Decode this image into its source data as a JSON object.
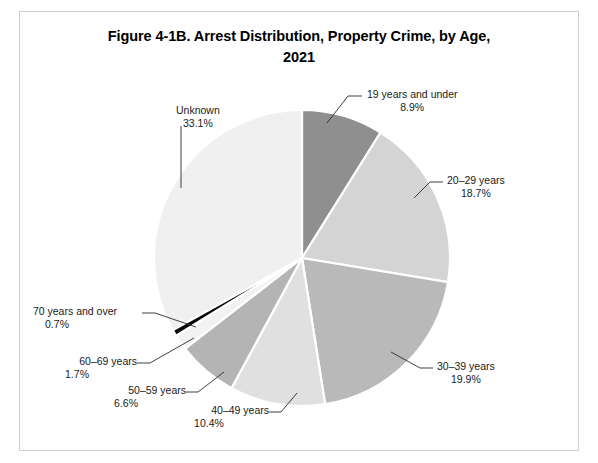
{
  "chart_data": {
    "type": "pie",
    "title_lines": [
      "Figure 4-1B. Arrest Distribution, Property Crime, by Age,",
      "2021"
    ],
    "units": "percent",
    "total": 100.0,
    "start_angle_deg": 0,
    "direction": "clockwise",
    "legend": "none (direct labels with leader lines)",
    "categories": [
      "19 years and under",
      "20–29 years",
      "30–39 years",
      "40–49 years",
      "50–59 years",
      "60–69 years",
      "70 years and over",
      "Unknown"
    ],
    "values": [
      8.9,
      18.7,
      19.9,
      10.4,
      6.6,
      1.7,
      0.7,
      33.1
    ],
    "colors": [
      "#8f8f8f",
      "#d4d4d4",
      "#b9b9b9",
      "#e0e0e0",
      "#b4b4b4",
      "#f2f2f2",
      "#0a0a0a",
      "#f0f0f0"
    ],
    "slices": [
      {
        "label": "19 years and under",
        "value": 8.9,
        "value_label": "8.9%",
        "color": "#8f8f8f",
        "label_x": 367,
        "label_y": 88,
        "align": "left",
        "leader": [
          [
            362,
            96
          ],
          [
            348,
            96
          ],
          [
            327,
            123
          ]
        ]
      },
      {
        "label": "20–29 years",
        "value": 18.7,
        "value_label": "18.7%",
        "color": "#d4d4d4",
        "label_x": 447,
        "label_y": 174,
        "align": "left",
        "leader": [
          [
            443,
            182
          ],
          [
            430,
            182
          ],
          [
            414,
            198
          ]
        ]
      },
      {
        "label": "30–39 years",
        "value": 19.9,
        "value_label": "19.9%",
        "color": "#b9b9b9",
        "label_x": 437,
        "label_y": 360,
        "align": "left",
        "leader": [
          [
            433,
            368
          ],
          [
            420,
            368
          ],
          [
            391,
            352
          ]
        ]
      },
      {
        "label": "40–49 years",
        "value": 10.4,
        "value_label": "10.4%",
        "color": "#e0e0e0",
        "label_x": 209,
        "label_y": 404,
        "align": "right",
        "leader": [
          [
            269,
            412
          ],
          [
            281,
            412
          ],
          [
            297,
            393
          ]
        ]
      },
      {
        "label": "50–59 years",
        "value": 6.6,
        "value_label": "6.6%",
        "color": "#b4b4b4",
        "label_x": 126,
        "label_y": 384,
        "align": "right",
        "leader": [
          [
            186,
            392
          ],
          [
            198,
            392
          ],
          [
            224,
            372
          ]
        ]
      },
      {
        "label": "60–69 years",
        "value": 1.7,
        "value_label": "1.7%",
        "color": "#f2f2f2",
        "label_x": 77,
        "label_y": 355,
        "align": "right",
        "leader": [
          [
            137,
            363
          ],
          [
            150,
            363
          ],
          [
            194,
            338
          ]
        ]
      },
      {
        "label": "70 years and over",
        "value": 0.7,
        "value_label": "0.7%",
        "color": "#0a0a0a",
        "label_x": 57,
        "label_y": 305,
        "align": "right",
        "leader": [
          [
            142,
            313
          ],
          [
            155,
            313
          ],
          [
            196,
            327
          ]
        ]
      },
      {
        "label": "Unknown",
        "value": 33.1,
        "value_label": "33.1%",
        "color": "#f0f0f0",
        "label_x": 176,
        "label_y": 104,
        "align": "left",
        "leader": [
          [
            181,
            126
          ],
          [
            181,
            188
          ]
        ]
      }
    ],
    "geometry": {
      "center_x": 302,
      "center_y": 258,
      "radius": 148,
      "slice_gap_stroke": "#ffffff",
      "slice_gap_width": 2.2
    }
  }
}
